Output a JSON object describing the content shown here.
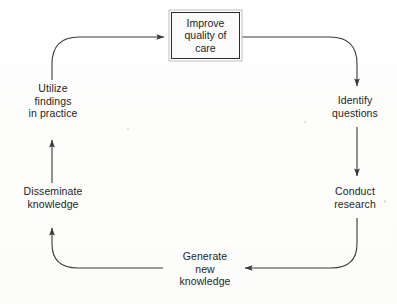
{
  "diagram": {
    "type": "cycle-flow-diagram",
    "title": "",
    "background_color": "#fdfdfd",
    "line_color": "#3a3a3a",
    "text_color": "#1e1e1e",
    "box": {
      "label": "Improve\nquality of\ncare",
      "border_color": "#2a2a2a",
      "fill_color": "#fbfbfb"
    },
    "nodes": [
      {
        "id": "improve-quality-of-care",
        "label": "Improve\nquality of\ncare",
        "shape": "rectangle",
        "position": "top"
      },
      {
        "id": "identify-questions",
        "label": "Identify\nquestions",
        "shape": "text",
        "position": "right-upper"
      },
      {
        "id": "conduct-research",
        "label": "Conduct\nresearch",
        "shape": "text",
        "position": "right-lower"
      },
      {
        "id": "generate-new-knowledge",
        "label": "Generate\nnew\nknowledge",
        "shape": "text",
        "position": "bottom"
      },
      {
        "id": "disseminate-knowledge",
        "label": "Disseminate\nknowledge",
        "shape": "text",
        "position": "left-lower"
      },
      {
        "id": "utilize-findings-in-practice",
        "label": "Utilize\nfindings\nin practice",
        "shape": "text",
        "position": "left-upper"
      }
    ],
    "edges": [
      {
        "from": "improve-quality-of-care",
        "to": "identify-questions",
        "arrow": "down",
        "style": "curved"
      },
      {
        "from": "identify-questions",
        "to": "conduct-research",
        "arrow": "down",
        "style": "straight"
      },
      {
        "from": "conduct-research",
        "to": "generate-new-knowledge",
        "arrow": "left",
        "style": "curved"
      },
      {
        "from": "generate-new-knowledge",
        "to": "disseminate-knowledge",
        "arrow": "up",
        "style": "curved"
      },
      {
        "from": "disseminate-knowledge",
        "to": "utilize-findings-in-practice",
        "arrow": "up",
        "style": "straight"
      },
      {
        "from": "utilize-findings-in-practice",
        "to": "improve-quality-of-care",
        "arrow": "right",
        "style": "curved"
      }
    ]
  }
}
